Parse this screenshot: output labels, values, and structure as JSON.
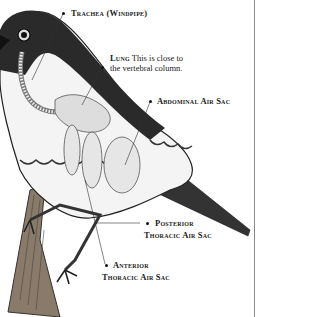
{
  "diagram": {
    "labels": {
      "trachea": "Trachea (Windpipe)",
      "lung_title": "Lung",
      "lung_note_1": "This is close to",
      "lung_note_2": "the vertebral column.",
      "abdominal": "Abdominal Air Sac",
      "posterior_1": "Posterior",
      "posterior_2": "Thoracic Air Sac",
      "anterior_1": "Anterior",
      "anterior_2": "Thoracic Air Sac"
    },
    "colors": {
      "ink": "#222222",
      "feather_dark": "#2a2a2a",
      "sac_fill": "#e6e6e6",
      "rule": "#888888"
    }
  }
}
